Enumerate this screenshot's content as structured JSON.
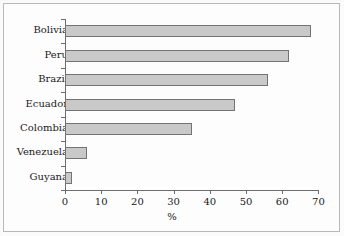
{
  "chart_data": {
    "type": "bar",
    "orientation": "horizontal",
    "title": "",
    "xlabel": "%",
    "ylabel": "",
    "categories": [
      "Bolivia",
      "Peru",
      "Brazil",
      "Ecuador",
      "Colombia",
      "Venezuela",
      "Guyana"
    ],
    "values": [
      68,
      62,
      56,
      47,
      35,
      6,
      2
    ],
    "xlim": [
      0,
      70
    ],
    "xticks": [
      0,
      10,
      20,
      30,
      40,
      50,
      60,
      70
    ],
    "xtick_labels": [
      "0",
      "10",
      "20",
      "30",
      "40",
      "50",
      "60",
      "70"
    ],
    "grid": false,
    "legend": false,
    "bar_fill_color": "#c9c9c9",
    "bar_border_color": "#737373",
    "axis_color": "#6d6d6d",
    "text_color": "#1a1a1a",
    "background_color": "#fdfdfd"
  }
}
